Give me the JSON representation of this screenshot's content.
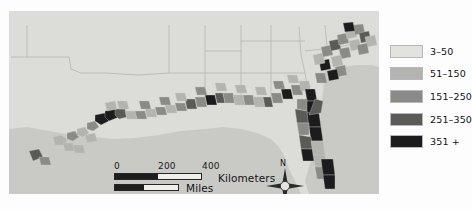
{
  "figure": {
    "kind": "choropleth-map",
    "region": "U.S. Gulf and South Atlantic coastal counties",
    "background_color": "#fdfdfd",
    "map_panel_color": "#e7e7e5",
    "water_color": "#c9c9c6",
    "land_color": "#dcdcd9",
    "boundary_color": "#b4b4b1"
  },
  "legend": {
    "swatch_border_color": "#b8b8b8",
    "items": [
      {
        "label": "3–50",
        "color": "#e2e2df",
        "min": 3,
        "max": 50
      },
      {
        "label": "51–150",
        "color": "#b3b3b0",
        "min": 51,
        "max": 150
      },
      {
        "label": "151–250",
        "color": "#8a8a87",
        "min": 151,
        "max": 250
      },
      {
        "label": "251–350",
        "color": "#5a5a57",
        "min": 251,
        "max": 350
      },
      {
        "label": "351 +",
        "color": "#1c1c1c",
        "min": 351,
        "max": null
      }
    ]
  },
  "scalebar": {
    "kilometers": {
      "unit_label": "Kilometers",
      "ticks": [
        "0",
        "200",
        "400"
      ],
      "tick_positions": [
        0,
        44,
        88
      ]
    },
    "miles": {
      "unit_label": "Miles",
      "ticks": [
        "0",
        "100",
        "200"
      ],
      "tick_positions": [
        0,
        30,
        65
      ]
    }
  },
  "compass": {
    "north_label": "N",
    "icon": "compass-rose-4-point"
  },
  "map_features": {
    "water_polygons": [
      "M 0,118 L 18,116 L 40,120 L 62,124 L 84,126 L 104,128 L 126,127 L 150,124 L 172,120 L 196,118 L 214,116 L 232,118 L 248,122 L 262,128 L 270,136 L 276,146 L 280,158 L 286,170 L 292,183 L 0,183 Z",
      "M 316,60 L 332,56 L 348,54 L 362,54 L 370,56 L 370,183 L 300,183 L 296,170 L 300,156 L 306,140 L 310,120 L 312,100 L 314,80 Z"
    ],
    "state_lines": [
      "M 18,14 L 18,46 L 2,46",
      "M 18,46 L 60,46 L 62,58 L 72,62 L 96,62 L 130,64 L 160,62",
      "M 160,14 L 160,62",
      "M 196,14 L 196,62 L 196,86",
      "M 160,62 L 196,62",
      "M 232,14 L 232,62 L 232,88",
      "M 196,62 L 232,62",
      "M 262,14 L 262,60 L 262,86",
      "M 232,62 L 262,62",
      "M 290,16 L 292,44 L 296,62 L 300,84",
      "M 262,62 L 296,62",
      "M 296,40 L 330,36 L 356,30",
      "M 316,14 L 318,36",
      "M 262,30 L 296,30",
      "M 232,30 L 262,30",
      "M 196,40 L 232,40"
    ],
    "choropleth_counties": [
      {
        "d": "M 44,126 L 52,124 L 58,128 L 56,134 L 46,134 Z",
        "bin": 1
      },
      {
        "d": "M 58,122 L 66,120 L 70,126 L 64,130 L 58,128 Z",
        "bin": 2
      },
      {
        "d": "M 68,118 L 76,116 L 80,122 L 74,126 L 68,124 Z",
        "bin": 1
      },
      {
        "d": "M 78,112 L 86,110 L 90,116 L 84,120 L 78,118 Z",
        "bin": 2
      },
      {
        "d": "M 86,104 L 96,102 L 100,110 L 92,114 L 86,110 Z",
        "bin": 4
      },
      {
        "d": "M 96,100 L 106,98 L 110,106 L 100,110 L 96,106 Z",
        "bin": 4
      },
      {
        "d": "M 106,98 L 116,98 L 118,106 L 110,108 L 106,104 Z",
        "bin": 3
      },
      {
        "d": "M 116,100 L 126,100 L 128,108 L 118,108 Z",
        "bin": 1
      },
      {
        "d": "M 126,100 L 136,100 L 138,108 L 128,108 Z",
        "bin": 2
      },
      {
        "d": "M 136,98 L 146,98 L 148,106 L 138,106 Z",
        "bin": 1
      },
      {
        "d": "M 146,96 L 156,96 L 158,104 L 148,104 Z",
        "bin": 2
      },
      {
        "d": "M 156,94 L 166,94 L 168,102 L 158,102 Z",
        "bin": 1
      },
      {
        "d": "M 166,92 L 176,92 L 178,100 L 168,100 Z",
        "bin": 2
      },
      {
        "d": "M 176,88 L 186,88 L 188,98 L 178,98 Z",
        "bin": 3
      },
      {
        "d": "M 186,86 L 196,86 L 198,96 L 188,96 Z",
        "bin": 2
      },
      {
        "d": "M 196,84 L 206,84 L 208,94 L 198,94 Z",
        "bin": 4
      },
      {
        "d": "M 206,82 L 214,82 L 216,92 L 208,92 Z",
        "bin": 3
      },
      {
        "d": "M 214,82 L 224,82 L 226,92 L 216,92 Z",
        "bin": 2
      },
      {
        "d": "M 224,84 L 234,84 L 236,94 L 226,94 Z",
        "bin": 1
      },
      {
        "d": "M 234,84 L 244,84 L 246,94 L 236,94 Z",
        "bin": 2
      },
      {
        "d": "M 244,86 L 254,86 L 256,96 L 246,96 Z",
        "bin": 1
      },
      {
        "d": "M 254,86 L 262,86 L 264,96 L 256,96 Z",
        "bin": 3
      },
      {
        "d": "M 262,82 L 272,82 L 274,92 L 264,92 Z",
        "bin": 2
      },
      {
        "d": "M 272,78 L 282,78 L 284,88 L 274,88 Z",
        "bin": 4
      },
      {
        "d": "M 282,74 L 292,74 L 294,84 L 284,84 Z",
        "bin": 2
      },
      {
        "d": "M 290,70 L 300,70 L 302,80 L 292,80 Z",
        "bin": 1
      },
      {
        "d": "M 296,78 L 306,78 L 308,90 L 298,90 Z",
        "bin": 4
      },
      {
        "d": "M 296,90 L 308,90 L 310,102 L 298,102 Z",
        "bin": 4
      },
      {
        "d": "M 288,88 L 298,88 L 298,100 L 288,98 Z",
        "bin": 2
      },
      {
        "d": "M 286,98 L 298,100 L 300,112 L 288,112 Z",
        "bin": 3
      },
      {
        "d": "M 298,102 L 310,102 L 312,116 L 300,116 Z",
        "bin": 4
      },
      {
        "d": "M 300,116 L 312,116 L 314,130 L 302,130 Z",
        "bin": 4
      },
      {
        "d": "M 288,112 L 300,112 L 300,124 L 290,124 Z",
        "bin": 2
      },
      {
        "d": "M 290,124 L 302,126 L 304,138 L 292,138 Z",
        "bin": 3
      },
      {
        "d": "M 292,138 L 304,138 L 306,150 L 294,150 Z",
        "bin": 4
      },
      {
        "d": "M 302,130 L 314,130 L 316,144 L 304,144 Z",
        "bin": 1
      },
      {
        "d": "M 304,144 L 316,144 L 318,156 L 306,156 Z",
        "bin": 1
      },
      {
        "d": "M 306,156 L 318,156 L 320,168 L 308,168 Z",
        "bin": 2
      },
      {
        "d": "M 312,148 L 324,148 L 326,164 L 314,164 Z",
        "bin": 4
      },
      {
        "d": "M 314,164 L 326,164 L 326,178 L 316,178 Z",
        "bin": 4
      },
      {
        "d": "M 300,104 L 312,102 L 314,90 L 306,88 Z",
        "bin": 3
      },
      {
        "d": "M 306,62 L 316,62 L 318,72 L 308,72 Z",
        "bin": 2
      },
      {
        "d": "M 310,50 L 320,48 L 322,58 L 312,60 Z",
        "bin": 4
      },
      {
        "d": "M 304,44 L 314,42 L 316,52 L 306,54 Z",
        "bin": 1
      },
      {
        "d": "M 312,36 L 322,34 L 324,44 L 314,46 Z",
        "bin": 2
      },
      {
        "d": "M 320,30 L 330,28 L 332,38 L 322,40 Z",
        "bin": 3
      },
      {
        "d": "M 328,24 L 338,22 L 340,32 L 330,34 Z",
        "bin": 2
      },
      {
        "d": "M 336,18 L 346,16 L 348,26 L 338,28 Z",
        "bin": 1
      },
      {
        "d": "M 344,14 L 354,13 L 356,22 L 346,24 Z",
        "bin": 2
      },
      {
        "d": "M 350,22 L 360,20 L 362,30 L 352,32 Z",
        "bin": 3
      },
      {
        "d": "M 340,30 L 350,28 L 352,38 L 342,40 Z",
        "bin": 1
      },
      {
        "d": "M 330,38 L 340,36 L 342,46 L 332,48 Z",
        "bin": 2
      },
      {
        "d": "M 322,46 L 332,44 L 334,54 L 324,56 Z",
        "bin": 1
      },
      {
        "d": "M 326,56 L 336,54 L 338,64 L 328,66 Z",
        "bin": 2
      },
      {
        "d": "M 318,60 L 328,58 L 330,68 L 320,70 Z",
        "bin": 4
      },
      {
        "d": "M 356,26 L 366,24 L 368,34 L 358,36 Z",
        "bin": 1
      },
      {
        "d": "M 348,34 L 358,32 L 360,42 L 350,44 Z",
        "bin": 2
      },
      {
        "d": "M 334,12 L 344,11 L 346,20 L 336,21 Z",
        "bin": 4
      },
      {
        "d": "M 20,140 L 30,138 L 34,146 L 24,150 Z",
        "bin": 3
      },
      {
        "d": "M 30,146 L 40,146 L 42,154 L 32,154 Z",
        "bin": 2
      },
      {
        "d": "M 54,132 L 64,132 L 66,140 L 56,140 Z",
        "bin": 1
      },
      {
        "d": "M 64,134 L 74,134 L 76,142 L 66,142 Z",
        "bin": 1
      },
      {
        "d": "M 76,124 L 86,122 L 88,130 L 78,132 Z",
        "bin": 1
      },
      {
        "d": "M 96,92 L 106,90 L 108,98 L 98,100 Z",
        "bin": 1
      },
      {
        "d": "M 108,90 L 118,90 L 120,98 L 110,98 Z",
        "bin": 1
      },
      {
        "d": "M 130,90 L 140,90 L 142,98 L 132,98 Z",
        "bin": 2
      },
      {
        "d": "M 150,86 L 160,86 L 162,94 L 152,94 Z",
        "bin": 2
      },
      {
        "d": "M 166,82 L 176,82 L 178,90 L 168,90 Z",
        "bin": 1
      },
      {
        "d": "M 186,76 L 196,76 L 198,84 L 188,84 Z",
        "bin": 2
      },
      {
        "d": "M 206,72 L 216,72 L 218,80 L 208,80 Z",
        "bin": 1
      },
      {
        "d": "M 226,74 L 236,74 L 238,82 L 228,82 Z",
        "bin": 1
      },
      {
        "d": "M 246,76 L 256,76 L 258,84 L 248,84 Z",
        "bin": 1
      },
      {
        "d": "M 264,70 L 274,70 L 276,78 L 266,78 Z",
        "bin": 2
      },
      {
        "d": "M 278,64 L 288,64 L 290,72 L 280,72 Z",
        "bin": 1
      }
    ]
  }
}
